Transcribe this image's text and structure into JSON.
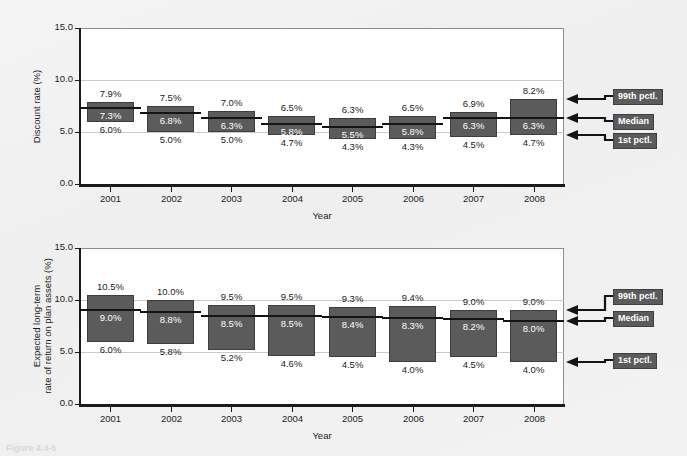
{
  "figure": {
    "caption": "Figure 4.4-5",
    "background_color": "#f2f2f2",
    "bar_color": "#5b5b5b",
    "median_color": "#141414",
    "gridline_color": "#c9c9c9",
    "axis_color": "#1a1a1a"
  },
  "legend": {
    "top_label": "99th pctl.",
    "median_label": "Median",
    "bottom_label": "1st pctl."
  },
  "chart_data": [
    {
      "type": "bar",
      "id": "discount-rate",
      "title": "",
      "xlabel": "Year",
      "ylabel": "Discount rate (%)",
      "ylabel_lines": [
        "Discount rate (%)"
      ],
      "categories": [
        "2001",
        "2002",
        "2003",
        "2004",
        "2005",
        "2006",
        "2007",
        "2008"
      ],
      "ylim": [
        0.0,
        15.0
      ],
      "ytick_labels": [
        "15.0",
        "10.0",
        "5.0",
        "0.0"
      ],
      "yticks": [
        15.0,
        10.0,
        5.0,
        0.0
      ],
      "grid": true,
      "gridlines_at": [
        10.0,
        5.0
      ],
      "legend_position": "right",
      "series": [
        {
          "name": "99th pctl.",
          "values": [
            7.9,
            7.5,
            7.0,
            6.5,
            6.3,
            6.5,
            6.9,
            8.2
          ]
        },
        {
          "name": "Median",
          "values": [
            7.3,
            6.8,
            6.3,
            5.8,
            5.5,
            5.8,
            6.3,
            6.3
          ]
        },
        {
          "name": "1st pctl.",
          "values": [
            6.0,
            5.0,
            5.0,
            4.7,
            4.3,
            4.3,
            4.5,
            4.7
          ]
        }
      ],
      "labels": {
        "top": [
          "7.9%",
          "7.5%",
          "7.0%",
          "6.5%",
          "6.3%",
          "6.5%",
          "6.9%",
          "8.2%"
        ],
        "median": [
          "7.3%",
          "6.8%",
          "6.3%",
          "5.8%",
          "5.5%",
          "5.8%",
          "6.3%",
          "6.3%"
        ],
        "bottom": [
          "6.0%",
          "5.0%",
          "5.0%",
          "4.7%",
          "4.3%",
          "4.3%",
          "4.5%",
          "4.7%"
        ]
      }
    },
    {
      "type": "bar",
      "id": "expected-return",
      "title": "",
      "xlabel": "Year",
      "ylabel": "Expected long-term rate of return on plan assets (%)",
      "ylabel_lines": [
        "Expected long-term",
        "rate of return on plan assets (%)"
      ],
      "categories": [
        "2001",
        "2002",
        "2003",
        "2004",
        "2005",
        "2006",
        "2007",
        "2008"
      ],
      "ylim": [
        0.0,
        15.0
      ],
      "ytick_labels": [
        "15.0",
        "10.0",
        "5.0",
        "0.0"
      ],
      "yticks": [
        15.0,
        10.0,
        5.0,
        0.0
      ],
      "grid": true,
      "gridlines_at": [
        10.0,
        5.0
      ],
      "legend_position": "right",
      "series": [
        {
          "name": "99th pctl.",
          "values": [
            10.5,
            10.0,
            9.5,
            9.5,
            9.3,
            9.4,
            9.0,
            9.0
          ]
        },
        {
          "name": "Median",
          "values": [
            9.0,
            8.8,
            8.5,
            8.5,
            8.4,
            8.3,
            8.2,
            8.0
          ]
        },
        {
          "name": "1st pctl.",
          "values": [
            6.0,
            5.8,
            5.2,
            4.6,
            4.5,
            4.0,
            4.5,
            4.0
          ]
        }
      ],
      "labels": {
        "top": [
          "10.5%",
          "10.0%",
          "9.5%",
          "9.5%",
          "9.3%",
          "9.4%",
          "9.0%",
          "9.0%"
        ],
        "median": [
          "9.0%",
          "8.8%",
          "8.5%",
          "8.5%",
          "8.4%",
          "8.3%",
          "8.2%",
          "8.0%"
        ],
        "bottom": [
          "6.0%",
          "5.8%",
          "5.2%",
          "4.6%",
          "4.5%",
          "4.0%",
          "4.5%",
          "4.0%"
        ]
      }
    }
  ]
}
